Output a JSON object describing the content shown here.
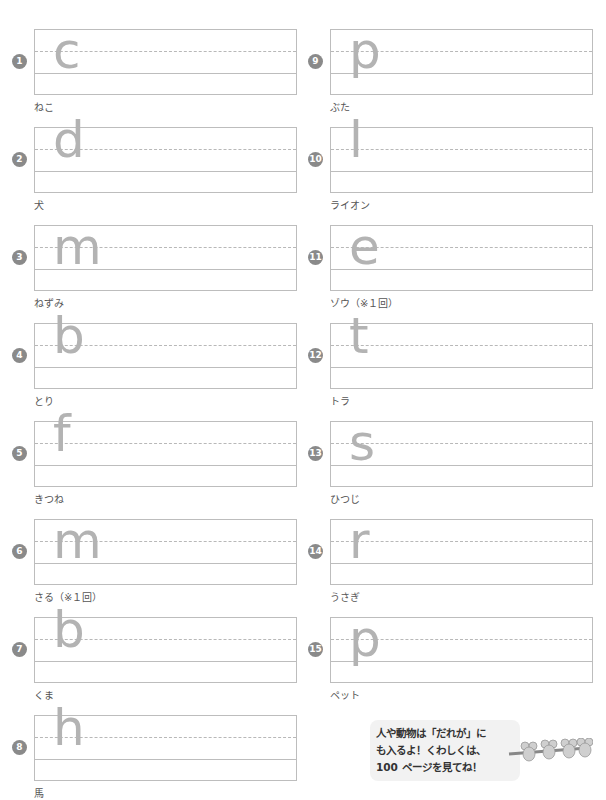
{
  "items": [
    {
      "num": "1",
      "letter": "c",
      "label": "ねこ"
    },
    {
      "num": "2",
      "letter": "d",
      "label": "犬"
    },
    {
      "num": "3",
      "letter": "m",
      "label": "ねずみ"
    },
    {
      "num": "4",
      "letter": "b",
      "label": "とり"
    },
    {
      "num": "5",
      "letter": "f",
      "label": "きつね"
    },
    {
      "num": "6",
      "letter": "m",
      "label": "さる（※１回）"
    },
    {
      "num": "7",
      "letter": "b",
      "label": "くま"
    },
    {
      "num": "8",
      "letter": "h",
      "label": "馬"
    },
    {
      "num": "9",
      "letter": "p",
      "label": "ぶた"
    },
    {
      "num": "10",
      "letter": "l",
      "label": "ライオン"
    },
    {
      "num": "11",
      "letter": "e",
      "label": "ゾウ（※１回）"
    },
    {
      "num": "12",
      "letter": "t",
      "label": "トラ"
    },
    {
      "num": "13",
      "letter": "s",
      "label": "ひつじ"
    },
    {
      "num": "14",
      "letter": "r",
      "label": "うさぎ"
    },
    {
      "num": "15",
      "letter": "p",
      "label": "ペット"
    }
  ],
  "note": {
    "line1": "人や動物は「だれが」に",
    "line2": "も入るよ！くわしくは、",
    "line3": "100 ページを見てね！"
  },
  "mascot_icon": "mouse-mascots-icon",
  "colors": {
    "guide_letter": "#b3b3b3",
    "line": "#bdbdbd",
    "number_badge": "#8a8a8a"
  }
}
